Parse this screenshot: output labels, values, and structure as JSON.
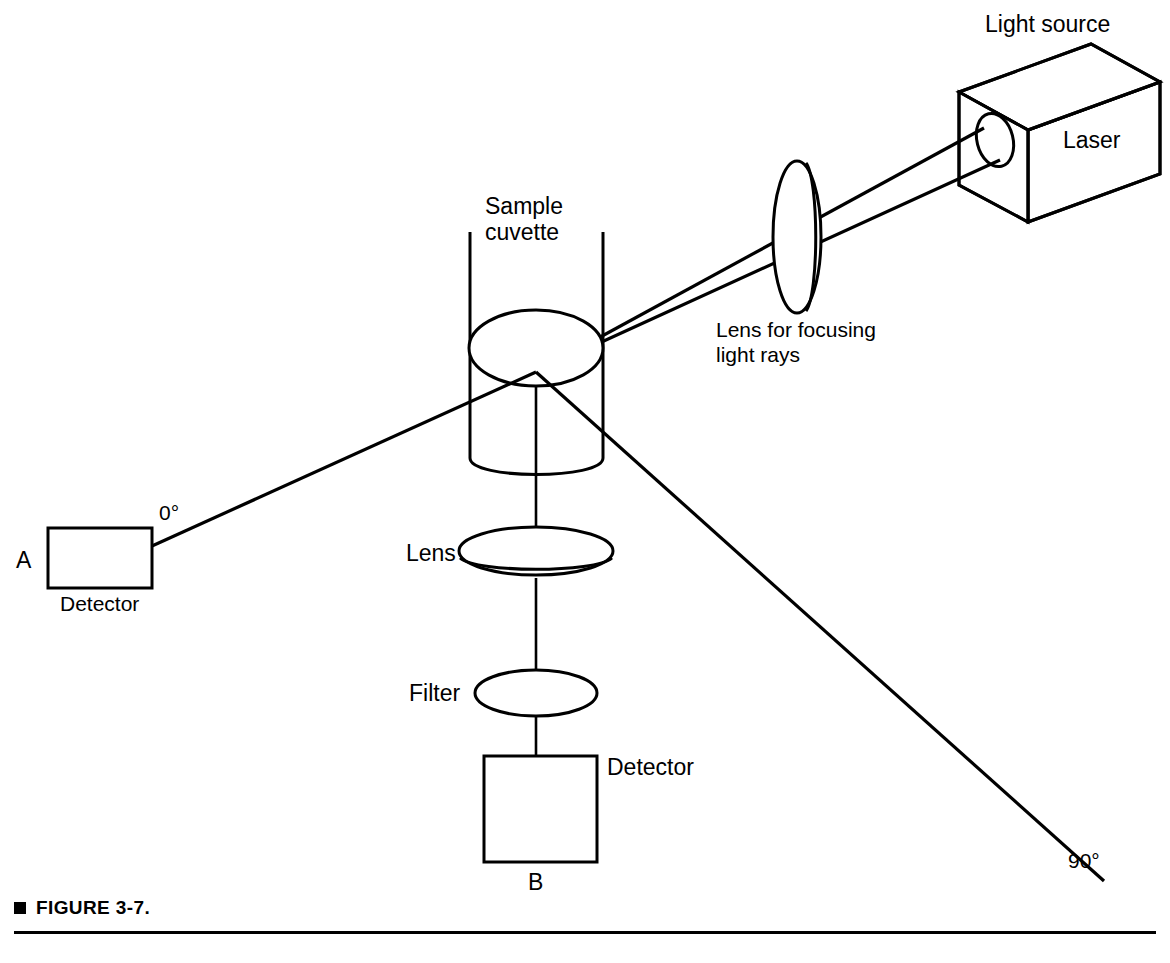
{
  "figure": {
    "caption_label": "FIGURE 3-7.",
    "bullet_icon": "filled-square-bullet"
  },
  "diagram": {
    "labels": {
      "light_source": "Light source",
      "laser": "Laser",
      "focusing_lens": "Lens for focusing",
      "focusing_lens_line2": "light rays",
      "sample_cuvette": "Sample",
      "sample_cuvette_line2": "cuvette",
      "lens": "Lens",
      "filter": "Filter",
      "detector_a": "Detector",
      "detector_a_letter": "A",
      "detector_b": "Detector",
      "detector_b_letter": "B",
      "angle_zero": "0°",
      "angle_ninety": "90°"
    },
    "components": [
      {
        "name": "laser-source-box",
        "type": "3d-box",
        "label": "Laser"
      },
      {
        "name": "laser-aperture",
        "type": "ellipse-aperture"
      },
      {
        "name": "focusing-lens",
        "type": "vertical-lens-disc"
      },
      {
        "name": "sample-cuvette",
        "type": "cylinder"
      },
      {
        "name": "collection-lens",
        "type": "horizontal-lens-disc"
      },
      {
        "name": "optical-filter",
        "type": "ellipse-lens"
      },
      {
        "name": "detector-a",
        "type": "rectangle"
      },
      {
        "name": "detector-b",
        "type": "square"
      }
    ],
    "beams": [
      {
        "name": "incident-beam",
        "from": "laser-aperture",
        "to": "sample-cuvette",
        "rays": 2
      },
      {
        "name": "transmitted-beam-0deg",
        "from": "sample-cuvette",
        "to": "detector-a",
        "angle": "0°"
      },
      {
        "name": "scattered-beam-90deg",
        "from": "sample-cuvette",
        "to": "lower-right",
        "angle": "90°"
      },
      {
        "name": "collection-axis",
        "from": "sample-cuvette",
        "to": "detector-b",
        "angle": "vertical"
      }
    ],
    "colors": {
      "stroke": "#000000",
      "background": "#ffffff"
    }
  }
}
